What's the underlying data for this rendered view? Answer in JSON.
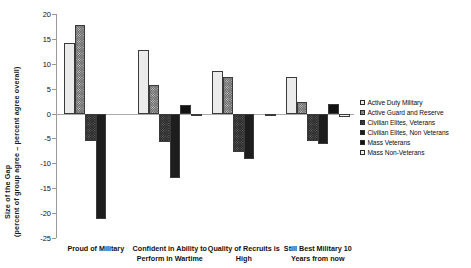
{
  "chart_data": {
    "type": "bar",
    "title": "",
    "xlabel": "",
    "ylabel": "Size of the Gap",
    "ylabel_sub": "(percent of group agree – percent agree overall)",
    "ylim": [
      -25,
      20
    ],
    "ytick_step": 5,
    "yticks": [
      20,
      15,
      10,
      5,
      0,
      -5,
      -10,
      -15,
      -20,
      -25
    ],
    "ytick_labels": [
      "20",
      "15",
      "10",
      "5",
      "0",
      "-5",
      "-10",
      "-15",
      "-20",
      "-25"
    ],
    "grid": false,
    "legend_position": "right",
    "categories": [
      "Proud of Military",
      "Confident in Ability to Perform in Wartime",
      "Quality of Recruits is High",
      "Still Best Military 10 Years from now"
    ],
    "series": [
      {
        "name": "Active Duty Military",
        "values": [
          14.2,
          12.7,
          8.5,
          7.3
        ]
      },
      {
        "name": "Active Guard and Reserve",
        "values": [
          17.8,
          5.8,
          7.3,
          2.3
        ]
      },
      {
        "name": "Civilian Elites, Veterans",
        "values": [
          -5.6,
          -5.7,
          -7.8,
          -5.5
        ]
      },
      {
        "name": "Civilian Elites, Non Veterans",
        "values": [
          -21.2,
          -13.0,
          -9.2,
          -6.1
        ]
      },
      {
        "name": "Mass Veterans",
        "values": [
          0.0,
          1.8,
          0.0,
          2.0
        ]
      },
      {
        "name": "Mass Non-Veterans",
        "values": [
          0.0,
          -0.4,
          -0.2,
          -0.6
        ]
      }
    ]
  },
  "legend": {
    "items": [
      {
        "label": "Active Duty Military"
      },
      {
        "label": "Active Guard and Reserve"
      },
      {
        "label": "Civilian Elites, Veterans"
      },
      {
        "label": "Civilian Elites, Non Veterans"
      },
      {
        "label": "Mass Veterans"
      },
      {
        "label": "Mass Non-Veterans"
      }
    ]
  },
  "colors": {
    "series1": "#ebebeb",
    "series2": "#6f6f6f",
    "series3": "#2b2b2b",
    "series4": "#1d1d1d",
    "series5": "#121212",
    "series6": "#f4f4f4",
    "axis": "#999999",
    "text": "#111111"
  }
}
